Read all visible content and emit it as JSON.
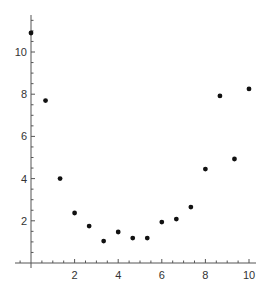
{
  "chart_data": {
    "type": "scatter",
    "title": "",
    "xlabel": "",
    "ylabel": "",
    "xlim": [
      -0.75,
      10.4
    ],
    "ylim": [
      -0.25,
      11.6
    ],
    "grid": false,
    "legend": null,
    "x_ticks": [
      2,
      4,
      6,
      8,
      10
    ],
    "y_ticks": [
      2,
      4,
      6,
      8,
      10
    ],
    "x_tick_labels": [
      "2",
      "4",
      "6",
      "8",
      "10"
    ],
    "y_tick_labels": [
      "2",
      "4",
      "6",
      "8",
      "10"
    ],
    "minor_tick_step": 0.5,
    "series": [
      {
        "name": "data",
        "color": "#111111",
        "x": [
          0,
          0.667,
          1.333,
          2,
          2.667,
          3.333,
          4,
          4.667,
          5.333,
          6,
          6.667,
          7.333,
          8,
          8.667,
          9.333,
          10
        ],
        "y": [
          10.9,
          7.7,
          4.0,
          2.37,
          1.75,
          1.04,
          1.47,
          1.18,
          1.18,
          1.94,
          2.08,
          2.65,
          4.45,
          7.92,
          4.93,
          8.25
        ]
      }
    ]
  },
  "layout": {
    "origin_px": [
      31,
      263
    ],
    "px_per_unit_x": 21.8,
    "px_per_unit_y": 21.1,
    "x_axis_px": [
      15,
      256
    ],
    "y_axis_px": [
      15,
      268
    ]
  }
}
